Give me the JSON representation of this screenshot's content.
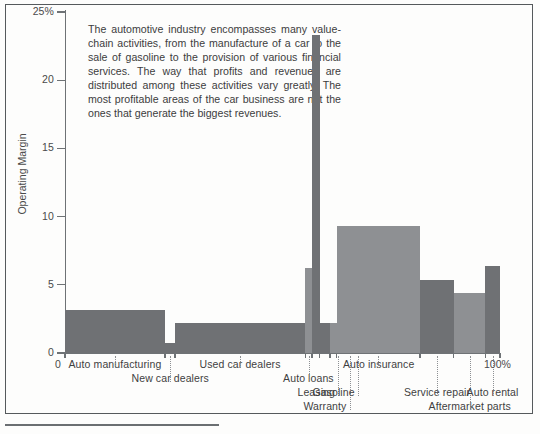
{
  "figure": {
    "caption": "The automotive industry encompasses many value-chain activities, from the manufacture of a car to the sale of gasoline to the provision of various financial services. The way that profits and revenues are distributed among these activities vary greatly. The most profitable areas of the car business are not the ones that generate the biggest revenues."
  },
  "chart_data": {
    "type": "bar",
    "title": "",
    "subtitle": "",
    "xlabel": "",
    "ylabel": "Operating Margin",
    "ylim": [
      0,
      25
    ],
    "xlim": [
      0,
      100
    ],
    "grid": false,
    "legend": null,
    "y_ticks": [
      "0",
      "5",
      "10",
      "15",
      "20",
      "25%"
    ],
    "y_tick_values": [
      0,
      5,
      10,
      15,
      20,
      25
    ],
    "x_ticks": [
      "0",
      "100%"
    ],
    "x_tick_values": [
      0,
      100
    ],
    "colors": {
      "bar_dark": "#6f7174",
      "bar_light": "#8e9093",
      "axis": "#6e7275",
      "frame": "#55595c",
      "text": "#3c3c3c"
    },
    "categories": [
      "Auto manufacturing",
      "New car dealers",
      "Used car dealers",
      "Auto loans",
      "Leasing",
      "Warranty",
      "Gasoline",
      "Auto insurance",
      "Service repair",
      "Aftermarket parts",
      "Auto rental"
    ],
    "values": [
      3.15,
      0.7,
      2.2,
      6.2,
      23.3,
      2.2,
      2.2,
      9.3,
      5.35,
      4.4,
      6.4
    ],
    "x_start": [
      0.0,
      23.0,
      25.3,
      55.2,
      56.8,
      58.6,
      60.9,
      62.5,
      81.6,
      89.4,
      96.6
    ],
    "x_end": [
      23.0,
      25.3,
      55.2,
      56.8,
      58.6,
      60.9,
      62.5,
      81.6,
      89.4,
      96.6,
      100.0
    ],
    "widths": [
      23.0,
      2.3,
      29.9,
      1.6,
      1.8,
      2.3,
      1.6,
      19.1,
      7.8,
      7.2,
      3.4
    ],
    "shades": [
      "dark",
      "dark",
      "dark",
      "light",
      "dark",
      "dark",
      "light",
      "light",
      "dark",
      "light",
      "dark"
    ],
    "label_rows": [
      0,
      1,
      0,
      1,
      2,
      3,
      2,
      0,
      2,
      3,
      2
    ]
  }
}
